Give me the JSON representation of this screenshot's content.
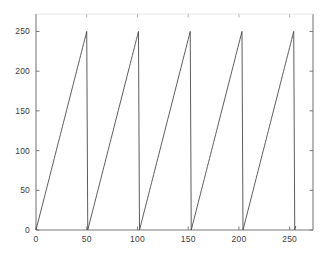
{
  "figure": {
    "background_color": "#ffffff",
    "axis_color": "#7a7a7a",
    "line_color": "#4a4a4a",
    "tick_label_color": "#3d3d3d",
    "title": "",
    "width": 333,
    "height": 259
  },
  "axes": {
    "box": true,
    "x_ticks": [
      "0",
      "50",
      "100",
      "150",
      "200",
      "250"
    ],
    "y_ticks": [
      "0",
      "50",
      "100",
      "150",
      "200",
      "250"
    ],
    "x_tick_values": [
      0,
      50,
      100,
      150,
      200,
      250
    ],
    "y_tick_values": [
      0,
      50,
      100,
      150,
      200,
      250
    ],
    "xlabel": "",
    "ylabel": ""
  },
  "chart_data": {
    "type": "line",
    "title": "",
    "xlabel": "",
    "ylabel": "",
    "xlim": [
      0,
      273
    ],
    "ylim": [
      0,
      272
    ],
    "xticks": [
      0,
      50,
      100,
      150,
      200,
      250
    ],
    "yticks": [
      0,
      50,
      100,
      150,
      200,
      250
    ],
    "grid": false,
    "legend": null,
    "series": [
      {
        "name": "sawtooth",
        "description": "Sawtooth ramp signal: linear rise from 0 to 255 with period 51, repeating 5 full cycles plus partial",
        "period": 51,
        "amplitude_min": 0,
        "amplitude_max": 255,
        "drop_x_positions": [
          50,
          101,
          152,
          203,
          254
        ],
        "x": [
          0,
          1,
          2,
          3,
          4,
          5,
          6,
          7,
          8,
          9,
          10,
          11,
          12,
          13,
          14,
          15,
          16,
          17,
          18,
          19,
          20,
          21,
          22,
          23,
          24,
          25,
          26,
          27,
          28,
          29,
          30,
          31,
          32,
          33,
          34,
          35,
          36,
          37,
          38,
          39,
          40,
          41,
          42,
          43,
          44,
          45,
          46,
          47,
          48,
          49,
          50,
          51,
          52,
          53,
          54,
          55,
          56,
          57,
          58,
          59,
          60,
          61,
          62,
          63,
          64,
          65,
          66,
          67,
          68,
          69,
          70,
          71,
          72,
          73,
          74,
          75,
          76,
          77,
          78,
          79,
          80,
          81,
          82,
          83,
          84,
          85,
          86,
          87,
          88,
          89,
          90,
          91,
          92,
          93,
          94,
          95,
          96,
          97,
          98,
          99,
          100,
          101,
          102,
          103,
          104,
          105,
          106,
          107,
          108,
          109,
          110,
          111,
          112,
          113,
          114,
          115,
          116,
          117,
          118,
          119,
          120,
          121,
          122,
          123,
          124,
          125,
          126,
          127,
          128,
          129,
          130,
          131,
          132,
          133,
          134,
          135,
          136,
          137,
          138,
          139,
          140,
          141,
          142,
          143,
          144,
          145,
          146,
          147,
          148,
          149,
          150,
          151,
          152,
          153,
          154,
          155,
          156,
          157,
          158,
          159,
          160,
          161,
          162,
          163,
          164,
          165,
          166,
          167,
          168,
          169,
          170,
          171,
          172,
          173,
          174,
          175,
          176,
          177,
          178,
          179,
          180,
          181,
          182,
          183,
          184,
          185,
          186,
          187,
          188,
          189,
          190,
          191,
          192,
          193,
          194,
          195,
          196,
          197,
          198,
          199,
          200,
          201,
          202,
          203,
          204,
          205,
          206,
          207,
          208,
          209,
          210,
          211,
          212,
          213,
          214,
          215,
          216,
          217,
          218,
          219,
          220,
          221,
          222,
          223,
          224,
          225,
          226,
          227,
          228,
          229,
          230,
          231,
          232,
          233,
          234,
          235,
          236,
          237,
          238,
          239,
          240,
          241,
          242,
          243,
          244,
          245,
          246,
          247,
          248,
          249,
          250,
          251,
          252,
          253,
          254,
          255,
          256
        ],
        "y": [
          0,
          5,
          10,
          15,
          20,
          25,
          30,
          35,
          40,
          45,
          50,
          55,
          60,
          65,
          70,
          75,
          80,
          85,
          90,
          95,
          100,
          105,
          110,
          115,
          120,
          125,
          130,
          135,
          140,
          145,
          150,
          155,
          160,
          165,
          170,
          175,
          180,
          185,
          190,
          195,
          200,
          205,
          210,
          215,
          220,
          225,
          230,
          235,
          240,
          245,
          250,
          0,
          5,
          10,
          15,
          20,
          25,
          30,
          35,
          40,
          45,
          50,
          55,
          60,
          65,
          70,
          75,
          80,
          85,
          90,
          95,
          100,
          105,
          110,
          115,
          120,
          125,
          130,
          135,
          140,
          145,
          150,
          155,
          160,
          165,
          170,
          175,
          180,
          185,
          190,
          195,
          200,
          205,
          210,
          215,
          220,
          225,
          230,
          235,
          240,
          245,
          250,
          0,
          5,
          10,
          15,
          20,
          25,
          30,
          35,
          40,
          45,
          50,
          55,
          60,
          65,
          70,
          75,
          80,
          85,
          90,
          95,
          100,
          105,
          110,
          115,
          120,
          125,
          130,
          135,
          140,
          145,
          150,
          155,
          160,
          165,
          170,
          175,
          180,
          185,
          190,
          195,
          200,
          205,
          210,
          215,
          220,
          225,
          230,
          235,
          240,
          245,
          250,
          0,
          5,
          10,
          15,
          20,
          25,
          30,
          35,
          40,
          45,
          50,
          55,
          60,
          65,
          70,
          75,
          80,
          85,
          90,
          95,
          100,
          105,
          110,
          115,
          120,
          125,
          130,
          135,
          140,
          145,
          150,
          155,
          160,
          165,
          170,
          175,
          180,
          185,
          190,
          195,
          200,
          205,
          210,
          215,
          220,
          225,
          230,
          235,
          240,
          245,
          250,
          0,
          5,
          10,
          15,
          20,
          25,
          30,
          35,
          40,
          45,
          50,
          55,
          60,
          65,
          70,
          75,
          80,
          85,
          90,
          95,
          100,
          105,
          110,
          115,
          120,
          125,
          130,
          135,
          140,
          145,
          150,
          155,
          160,
          165,
          170,
          175,
          180,
          185,
          190,
          195,
          200,
          205,
          210,
          215,
          220,
          225,
          230,
          235,
          240,
          245,
          250,
          0,
          5
        ]
      }
    ]
  }
}
